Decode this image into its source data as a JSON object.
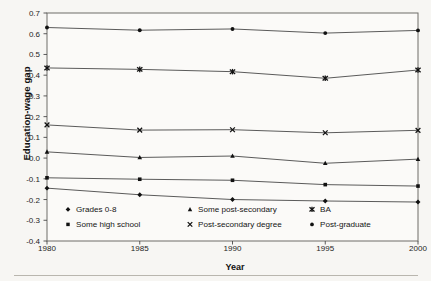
{
  "figure": {
    "background_color": "#f7f6f3",
    "frame_color": "#6f6d68"
  },
  "chart_data": {
    "type": "line",
    "title": "",
    "xlabel": "Year",
    "ylabel": "Education-wage gap",
    "x": [
      1980,
      1985,
      1990,
      1995,
      2000
    ],
    "xticklabels": [
      "1980",
      "1985",
      "1990",
      "1995",
      "2000"
    ],
    "ylim": [
      -0.4,
      0.7
    ],
    "yticks": [
      -0.4,
      -0.3,
      -0.2,
      -0.1,
      0.0,
      0.1,
      0.2,
      0.3,
      0.4,
      0.5,
      0.6,
      0.7
    ],
    "yticklabels": [
      "-0.4",
      "-0.3",
      "-0.2",
      "-0.1",
      "0.0",
      "0.1",
      "0.2",
      "0.3",
      "0.4",
      "0.5",
      "0.6",
      "0.7"
    ],
    "grid": false,
    "legend_position": "inside-bottom",
    "line_color": "#3d3d3d",
    "series": [
      {
        "name": "Grades 0-8",
        "marker": "diamond",
        "values": [
          -0.145,
          -0.177,
          -0.2,
          -0.207,
          -0.212
        ]
      },
      {
        "name": "Some high school",
        "marker": "square",
        "values": [
          -0.095,
          -0.102,
          -0.107,
          -0.128,
          -0.135
        ]
      },
      {
        "name": "Some post-secondary",
        "marker": "triangle",
        "values": [
          0.03,
          0.003,
          0.01,
          -0.025,
          -0.005
        ]
      },
      {
        "name": "Post-secondary degree",
        "marker": "cross",
        "values": [
          0.16,
          0.135,
          0.137,
          0.122,
          0.134
        ]
      },
      {
        "name": "BA",
        "marker": "asterisk",
        "values": [
          0.435,
          0.428,
          0.417,
          0.385,
          0.425
        ]
      },
      {
        "name": "Post-graduate",
        "marker": "circle",
        "values": [
          0.63,
          0.617,
          0.623,
          0.603,
          0.616
        ]
      }
    ]
  },
  "legend": {
    "entries": [
      {
        "label": "Grades 0-8",
        "marker": "diamond"
      },
      {
        "label": "Some post-secondary",
        "marker": "triangle"
      },
      {
        "label": "BA",
        "marker": "asterisk"
      },
      {
        "label": "Some high school",
        "marker": "square"
      },
      {
        "label": "Post-secondary degree",
        "marker": "cross"
      },
      {
        "label": "Post-graduate",
        "marker": "circle"
      }
    ]
  }
}
